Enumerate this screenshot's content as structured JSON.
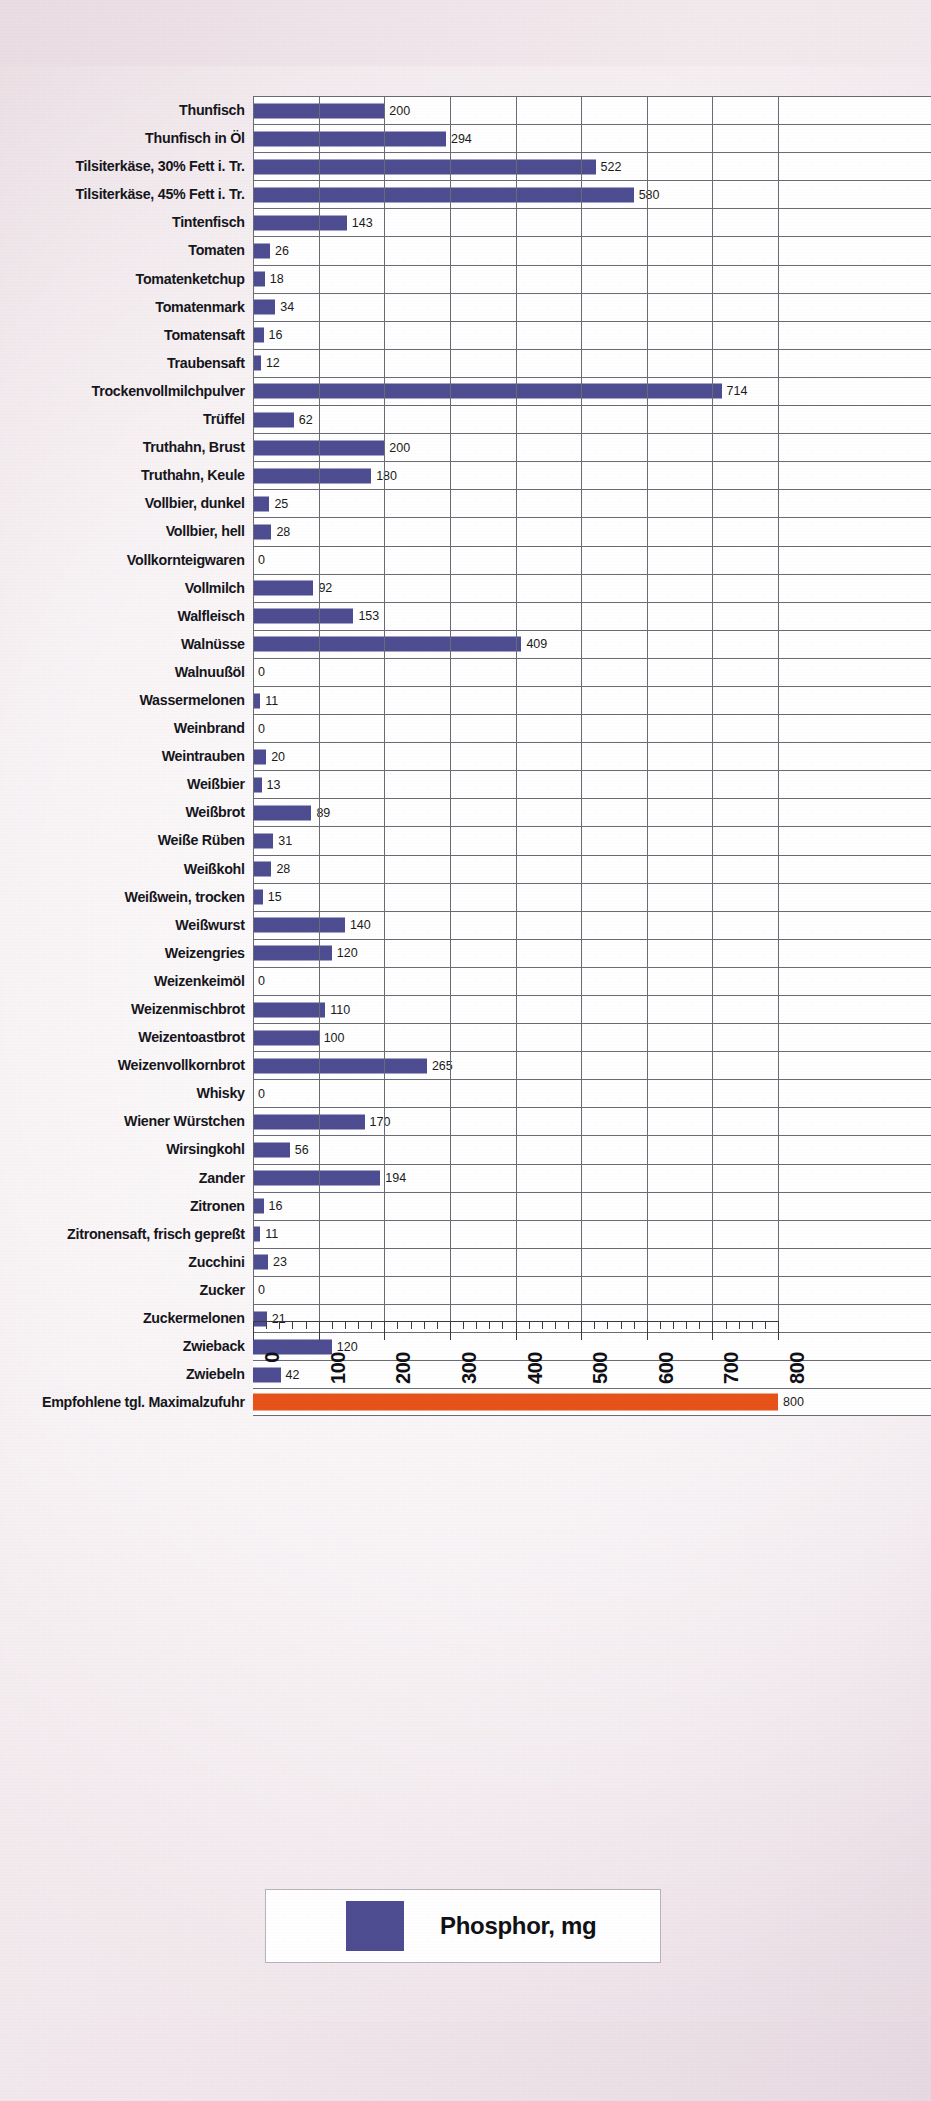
{
  "chart_data": {
    "type": "bar",
    "orientation": "horizontal",
    "title": "",
    "xlabel": "",
    "ylabel": "",
    "xlim": [
      0,
      800
    ],
    "xticks": [
      0,
      100,
      200,
      300,
      400,
      500,
      600,
      700,
      800
    ],
    "xtick_labels": [
      "0",
      "100",
      "200",
      "300",
      "400",
      "500",
      "600",
      "700",
      "800"
    ],
    "grid": "vertical-and-horizontal",
    "legend": {
      "position": "bottom-center",
      "entries": [
        {
          "label": "Phosphor, mg",
          "color": "#4e4d92"
        }
      ]
    },
    "colors": {
      "bar": "#4e4d92",
      "reference_bar": "#e8531a",
      "grid": "#6b6b74",
      "plot_background": "#ffffff",
      "page_background": "#efe4e9",
      "text": "#16161c"
    },
    "categories": [
      "Thunfisch",
      "Thunfisch in Öl",
      "Tilsiterkäse, 30% Fett i. Tr.",
      "Tilsiterkäse, 45% Fett i. Tr.",
      "Tintenfisch",
      "Tomaten",
      "Tomatenketchup",
      "Tomatenmark",
      "Tomatensaft",
      "Traubensaft",
      "Trockenvollmilchpulver",
      "Trüffel",
      "Truthahn, Brust",
      "Truthahn, Keule",
      "Vollbier, dunkel",
      "Vollbier, hell",
      "Vollkornteigwaren",
      "Vollmilch",
      "Walfleisch",
      "Walnüsse",
      "Walnuußöl",
      "Wassermelonen",
      "Weinbrand",
      "Weintrauben",
      "Weißbier",
      "Weißbrot",
      "Weiße Rüben",
      "Weißkohl",
      "Weißwein, trocken",
      "Weißwurst",
      "Weizengries",
      "Weizenkeimöl",
      "Weizenmischbrot",
      "Weizentoastbrot",
      "Weizenvollkornbrot",
      "Whisky",
      "Wiener Würstchen",
      "Wirsingkohl",
      "Zander",
      "Zitronen",
      "Zitronensaft, frisch gepreßt",
      "Zucchini",
      "Zucker",
      "Zuckermelonen",
      "Zwieback",
      "Zwiebeln",
      "Empfohlene tgl. Maximalzufuhr"
    ],
    "values": [
      200,
      294,
      522,
      580,
      143,
      26,
      18,
      34,
      16,
      12,
      714,
      62,
      200,
      180,
      25,
      28,
      0,
      92,
      153,
      409,
      0,
      11,
      0,
      20,
      13,
      89,
      31,
      28,
      15,
      140,
      120,
      0,
      110,
      100,
      265,
      0,
      170,
      56,
      194,
      16,
      11,
      23,
      0,
      21,
      120,
      42,
      800
    ],
    "value_labels": [
      "200",
      "294",
      "522",
      "580",
      "143",
      "26",
      "18",
      "34",
      "16",
      "12",
      "714",
      "62",
      "200",
      "180",
      "25",
      "28",
      "0",
      "92",
      "153",
      "409",
      "0",
      "11",
      "0",
      "20",
      "13",
      "89",
      "31",
      "28",
      "15",
      "140",
      "120",
      "0",
      "110",
      "100",
      "265",
      "0",
      "170",
      "56",
      "194",
      "16",
      "11",
      "23",
      "0",
      "21",
      "120",
      "42",
      "800"
    ],
    "reference_row_index": 46
  }
}
